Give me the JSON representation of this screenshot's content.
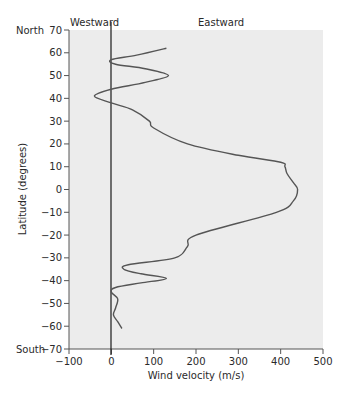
{
  "chart_data": {
    "type": "line",
    "title": "",
    "xlabel": "Wind velocity (m/s)",
    "ylabel": "Latitude (degrees)",
    "xlim": [
      -100,
      500
    ],
    "ylim": [
      -70,
      70
    ],
    "x_ticks": [
      -100,
      0,
      100,
      200,
      300,
      400,
      500
    ],
    "y_ticks": [
      70,
      60,
      50,
      40,
      30,
      20,
      10,
      0,
      -10,
      -20,
      -30,
      -40,
      -50,
      -60,
      -70
    ],
    "grid": false,
    "legend": null,
    "annotations": {
      "top_left": "Westward",
      "top_right": "Eastward",
      "north": "North",
      "south": "South"
    },
    "series": [
      {
        "name": "Zonal wind profile",
        "points": [
          {
            "lat": 62,
            "v": 130
          },
          {
            "lat": 59,
            "v": 60
          },
          {
            "lat": 57,
            "v": 0
          },
          {
            "lat": 55,
            "v": 10
          },
          {
            "lat": 53,
            "v": 80
          },
          {
            "lat": 50,
            "v": 135
          },
          {
            "lat": 47,
            "v": 80
          },
          {
            "lat": 44,
            "v": 0
          },
          {
            "lat": 41,
            "v": -40
          },
          {
            "lat": 38,
            "v": 0
          },
          {
            "lat": 35,
            "v": 50
          },
          {
            "lat": 30,
            "v": 90
          },
          {
            "lat": 27,
            "v": 100
          },
          {
            "lat": 20,
            "v": 180
          },
          {
            "lat": 15,
            "v": 300
          },
          {
            "lat": 12,
            "v": 400
          },
          {
            "lat": 10,
            "v": 410
          },
          {
            "lat": 7,
            "v": 415
          },
          {
            "lat": 3,
            "v": 430
          },
          {
            "lat": 0,
            "v": 440
          },
          {
            "lat": -5,
            "v": 430
          },
          {
            "lat": -10,
            "v": 390
          },
          {
            "lat": -20,
            "v": 200
          },
          {
            "lat": -25,
            "v": 180
          },
          {
            "lat": -30,
            "v": 150
          },
          {
            "lat": -33,
            "v": 40
          },
          {
            "lat": -35,
            "v": 30
          },
          {
            "lat": -37,
            "v": 70
          },
          {
            "lat": -39,
            "v": 130
          },
          {
            "lat": -41,
            "v": 70
          },
          {
            "lat": -43,
            "v": 10
          },
          {
            "lat": -45,
            "v": 0
          },
          {
            "lat": -48,
            "v": 15
          },
          {
            "lat": -52,
            "v": 10
          },
          {
            "lat": -55,
            "v": 5
          },
          {
            "lat": -58,
            "v": 15
          },
          {
            "lat": -61,
            "v": 25
          }
        ]
      }
    ]
  },
  "labels": {
    "westward": "Westward",
    "eastward": "Eastward",
    "north": "North",
    "south": "South",
    "xlabel": "Wind velocity (m/s)",
    "ylabel": "Latitude (degrees)"
  },
  "colors": {
    "plot_bg": "#ececec",
    "axis": "#555555",
    "curve": "#555555",
    "zero_line": "#1a1a1a"
  }
}
